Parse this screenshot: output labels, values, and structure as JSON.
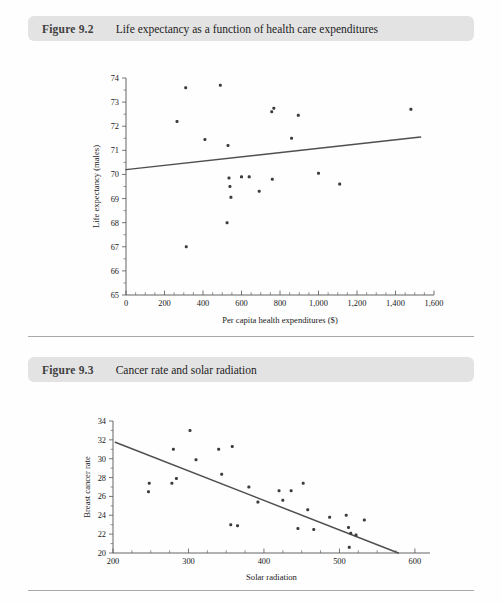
{
  "page": {
    "background": "#fefefe",
    "header_bar_color": "#e3e3e3",
    "rule_color": "#a9a9a9",
    "marker_color": "#3c3c3c",
    "trend_color": "#4f4f4f"
  },
  "figures": [
    {
      "number": "Figure 9.2",
      "title": "Life expectancy as a function of health care expenditures"
    },
    {
      "number": "Figure 9.3",
      "title": "Cancer rate and solar radiation"
    }
  ],
  "chart_data": [
    {
      "type": "scatter",
      "title": "Life expectancy as a function of health care expenditures",
      "xlabel": "Per capita health expenditures ($)",
      "ylabel": "Life expectancy (males)",
      "xlim": [
        0,
        1600
      ],
      "ylim": [
        65,
        74
      ],
      "xticks": [
        0,
        200,
        400,
        600,
        800,
        1000,
        1200,
        1400,
        1600
      ],
      "xtick_labels": [
        "0",
        "200",
        "400",
        "600",
        "800",
        "1,000",
        "1,200",
        "1,400",
        "1,600"
      ],
      "yticks": [
        65,
        66,
        67,
        68,
        69,
        70,
        71,
        72,
        73,
        74
      ],
      "ytick_labels": [
        "65",
        "66",
        "67",
        "68",
        "69",
        "70",
        "71",
        "72",
        "73",
        "74"
      ],
      "grid": false,
      "legend": "none",
      "points": [
        {
          "x": 310,
          "y": 73.6
        },
        {
          "x": 490,
          "y": 73.7
        },
        {
          "x": 265,
          "y": 72.2
        },
        {
          "x": 410,
          "y": 71.45
        },
        {
          "x": 530,
          "y": 71.2
        },
        {
          "x": 535,
          "y": 69.85
        },
        {
          "x": 600,
          "y": 69.9
        },
        {
          "x": 540,
          "y": 69.5
        },
        {
          "x": 545,
          "y": 69.05
        },
        {
          "x": 525,
          "y": 68.0
        },
        {
          "x": 313,
          "y": 67.0
        },
        {
          "x": 757,
          "y": 72.6
        },
        {
          "x": 768,
          "y": 72.75
        },
        {
          "x": 895,
          "y": 72.45
        },
        {
          "x": 860,
          "y": 71.5
        },
        {
          "x": 1480,
          "y": 72.7
        },
        {
          "x": 640,
          "y": 69.9
        },
        {
          "x": 760,
          "y": 69.8
        },
        {
          "x": 692,
          "y": 69.3
        },
        {
          "x": 1000,
          "y": 70.05
        },
        {
          "x": 1110,
          "y": 69.6
        }
      ],
      "trend": {
        "x0": 0,
        "y0": 70.2,
        "x1": 1530,
        "y1": 71.55
      }
    },
    {
      "type": "scatter",
      "title": "Cancer rate and solar radiation",
      "xlabel": "Solar radiation",
      "ylabel": "Breast cancer rate",
      "xlim": [
        200,
        620
      ],
      "ylim": [
        20,
        34
      ],
      "xticks": [
        200,
        300,
        400,
        500,
        600
      ],
      "xtick_labels": [
        "200",
        "300",
        "400",
        "500",
        "600"
      ],
      "yticks": [
        20,
        22,
        24,
        26,
        28,
        30,
        32,
        34
      ],
      "ytick_labels": [
        "20",
        "22",
        "24",
        "26",
        "28",
        "30",
        "32",
        "34"
      ],
      "grid": false,
      "legend": "none",
      "points": [
        {
          "x": 248,
          "y": 27.4
        },
        {
          "x": 247,
          "y": 26.5
        },
        {
          "x": 278,
          "y": 27.4
        },
        {
          "x": 284,
          "y": 27.9
        },
        {
          "x": 280,
          "y": 31.0
        },
        {
          "x": 302,
          "y": 33.0
        },
        {
          "x": 310,
          "y": 29.9
        },
        {
          "x": 340,
          "y": 31.0
        },
        {
          "x": 358,
          "y": 31.3
        },
        {
          "x": 344,
          "y": 28.35
        },
        {
          "x": 356,
          "y": 23.0
        },
        {
          "x": 380,
          "y": 27.0
        },
        {
          "x": 392,
          "y": 25.4
        },
        {
          "x": 365,
          "y": 22.9
        },
        {
          "x": 420,
          "y": 26.6
        },
        {
          "x": 436,
          "y": 26.6
        },
        {
          "x": 425,
          "y": 25.6
        },
        {
          "x": 452,
          "y": 27.4
        },
        {
          "x": 458,
          "y": 24.6
        },
        {
          "x": 445,
          "y": 22.6
        },
        {
          "x": 466,
          "y": 22.5
        },
        {
          "x": 487,
          "y": 23.8
        },
        {
          "x": 509,
          "y": 24.0
        },
        {
          "x": 512,
          "y": 22.7
        },
        {
          "x": 515,
          "y": 22.1
        },
        {
          "x": 513,
          "y": 20.6
        },
        {
          "x": 522,
          "y": 21.9
        },
        {
          "x": 533,
          "y": 23.5
        }
      ],
      "trend": {
        "x0": 203,
        "y0": 31.75,
        "x1": 578,
        "y1": 20.0
      }
    }
  ]
}
